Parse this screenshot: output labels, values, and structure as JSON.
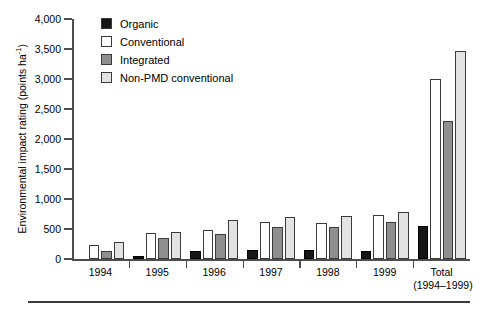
{
  "chart_data": {
    "type": "bar",
    "title": "",
    "xlabel": "",
    "ylabel": "Environmental impact rating (points ha-1)",
    "ylabel_html": "Environmental impact rating (points ha<sup>-1</sup>)",
    "ylim": [
      0,
      4000
    ],
    "yticks": [
      0,
      500,
      1000,
      1500,
      2000,
      2500,
      3000,
      3500,
      4000
    ],
    "ytick_labels": [
      "0",
      "500",
      "1,000",
      "1,500",
      "2,000",
      "2,500",
      "3,000",
      "3,500",
      "4,000"
    ],
    "grid": false,
    "legend_position": "top-center-left",
    "categories": [
      "1994",
      "1995",
      "1996",
      "1997",
      "1998",
      "1999",
      "Total"
    ],
    "category_sublabels": [
      "",
      "",
      "",
      "",
      "",
      "",
      "(1994–1999)"
    ],
    "series": [
      {
        "name": "Organic",
        "color": "#161616",
        "values": [
          0,
          50,
          130,
          150,
          150,
          140,
          550
        ]
      },
      {
        "name": "Conventional",
        "color": "#ffffff",
        "values": [
          230,
          430,
          490,
          620,
          600,
          730,
          3000
        ]
      },
      {
        "name": "Integrated",
        "color": "#8f8f8f",
        "values": [
          140,
          350,
          420,
          530,
          530,
          610,
          2300
        ]
      },
      {
        "name": "Non-PMD conventional",
        "color": "#e3e3e3",
        "values": [
          280,
          450,
          650,
          700,
          720,
          790,
          3470
        ]
      }
    ]
  },
  "legend": {
    "items": [
      {
        "label": "Organic",
        "color": "#161616"
      },
      {
        "label": "Conventional",
        "color": "#ffffff"
      },
      {
        "label": "Integrated",
        "color": "#8f8f8f"
      },
      {
        "label": "Non-PMD conventional",
        "color": "#e3e3e3"
      }
    ]
  }
}
